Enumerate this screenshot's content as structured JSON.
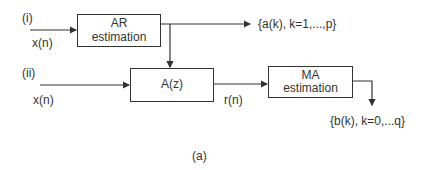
{
  "diagram": {
    "part_i": {
      "label": "(i)",
      "input": "x(n)",
      "block": {
        "line1": "AR",
        "line2": "estimation"
      },
      "output": "{a(k), k=1,...,p}"
    },
    "part_ii": {
      "label": "(ii)",
      "input": "x(n)",
      "filter_block": "A(z)",
      "intermediate": "r(n)",
      "block": {
        "line1": "MA",
        "line2": "estimation"
      },
      "output": "{b(k), k=0,...q}"
    },
    "caption": "(a)",
    "colors": {
      "line": "#333333",
      "background": "#ffffff"
    }
  }
}
